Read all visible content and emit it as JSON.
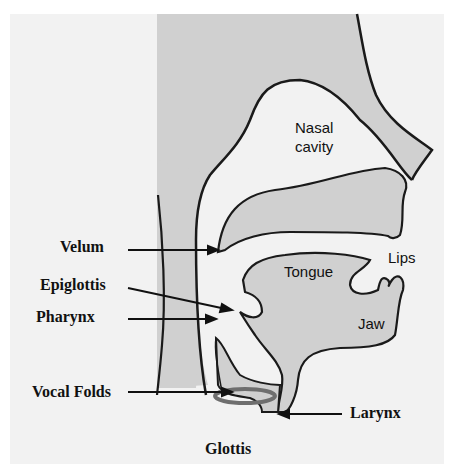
{
  "diagram": {
    "type": "anatomical-vocal-tract",
    "colors": {
      "background": "#ffffff",
      "panel": "#f2f2f2",
      "tissue_fill": "#d0d0d0",
      "outline": "#1a1a1a",
      "vocal_folds": "#6e6e6e"
    },
    "inner_labels": {
      "nasal_cavity_line1": "Nasal",
      "nasal_cavity_line2": "cavity",
      "tongue": "Tongue",
      "lips": "Lips",
      "jaw": "Jaw"
    },
    "callout_labels": {
      "velum": "Velum",
      "epiglottis": "Epiglottis",
      "pharynx": "Pharynx",
      "vocal_folds": "Vocal Folds",
      "larynx": "Larynx",
      "glottis": "Glottis"
    }
  }
}
